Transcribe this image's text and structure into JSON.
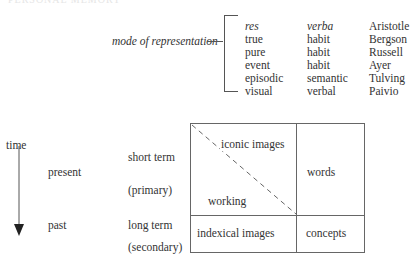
{
  "header": {
    "running_head": "PERSONAL MEMORY"
  },
  "representation": {
    "label": "mode of representation",
    "rows": [
      {
        "a": "res",
        "b": "verba",
        "author": "Aristotle",
        "italic": true
      },
      {
        "a": "true",
        "b": "habit",
        "author": "Bergson"
      },
      {
        "a": "pure",
        "b": "habit",
        "author": "Russell"
      },
      {
        "a": "event",
        "b": "habit",
        "author": "Ayer"
      },
      {
        "a": "episodic",
        "b": "semantic",
        "author": "Tulving"
      },
      {
        "a": "visual",
        "b": "verbal",
        "author": "Paivio"
      }
    ]
  },
  "time_axis": {
    "label": "time",
    "present": "present",
    "past": "past",
    "short_term": "short term",
    "primary": "(primary)",
    "long_term": "long term",
    "secondary": "(secondary)"
  },
  "grid": {
    "iconic_images": "iconic images",
    "working": "working",
    "words": "words",
    "indexical_images": "indexical images",
    "concepts": "concepts"
  }
}
